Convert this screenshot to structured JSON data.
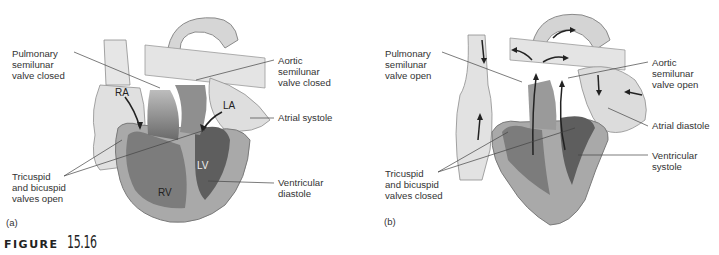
{
  "figure": {
    "caption_word": "FIGURE",
    "caption_number": "15.16"
  },
  "panels": [
    {
      "letter": "(a)",
      "chambers": {
        "ra": "RA",
        "la": "LA",
        "rv": "RV",
        "lv": "LV"
      },
      "labels": {
        "pulmonary_valve": "Pulmonary\nsemilunar\nvalve closed",
        "aortic_valve": "Aortic\nsemilunar\nvalve closed",
        "atrial_phase": "Atrial systole",
        "av_valves": "Tricuspid\nand bicuspid\nvalves open",
        "ventricular_phase": "Ventricular\ndiastole"
      }
    },
    {
      "letter": "(b)",
      "labels": {
        "pulmonary_valve": "Pulmonary\nsemilunar\nvalve open",
        "aortic_valve": "Aortic\nsemilunar\nvalve open",
        "atrial_phase": "Atrial diastole",
        "av_valves": "Tricuspid\nand bicuspid\nvalves closed",
        "ventricular_phase": "Ventricular\nsystole"
      }
    }
  ],
  "colors": {
    "vessel_fill": "#e2e2e2",
    "wall_fill": "#a8a8a8",
    "chamber_dark": "#6e6e6e",
    "chamber_mid": "#8a8a8a",
    "outline": "#7a7a7a",
    "leader_line": "#444444"
  }
}
